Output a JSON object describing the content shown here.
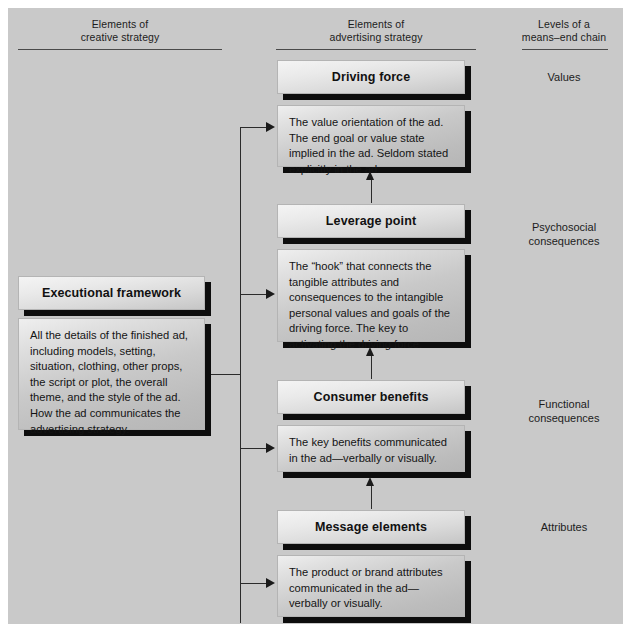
{
  "diagram": {
    "background_color": "#c9c9c9",
    "columns": [
      {
        "id": "creative",
        "line1": "Elements of",
        "line2": "creative strategy"
      },
      {
        "id": "advertising",
        "line1": "Elements of",
        "line2": "advertising strategy"
      },
      {
        "id": "levels",
        "line1": "Levels of a",
        "line2": "means–end chain"
      }
    ],
    "left_column": {
      "title_box": "Executional framework",
      "description_box": "All the details of the finished ad, including models, setting, situation, clothing, other props, the script or plot, the overall theme, and the style of the ad. How the ad communicates the advertising strategy."
    },
    "center_column": [
      {
        "id": "driving-force",
        "title": "Driving force",
        "description": "The value orientation of the ad. The end goal or value state implied in the ad. Seldom stated explicitly in the ad."
      },
      {
        "id": "leverage-point",
        "title": "Leverage point",
        "description": "The “hook” that connects the tangible attributes and consequences to  the intangible personal values and goals of the driving force. The key to activating the driving force."
      },
      {
        "id": "consumer-benefits",
        "title": "Consumer benefits",
        "description": "The key benefits communicated in the ad—verbally or visually."
      },
      {
        "id": "message-elements",
        "title": "Message elements",
        "description": "The product or brand attributes communicated in the ad—verbally or visually."
      }
    ],
    "right_column": [
      {
        "id": "values",
        "label": "Values"
      },
      {
        "id": "psychosocial",
        "label": "Psychosocial\nconsequences"
      },
      {
        "id": "functional",
        "label": "Functional\nconsequences"
      },
      {
        "id": "attributes",
        "label": "Attributes"
      }
    ]
  }
}
